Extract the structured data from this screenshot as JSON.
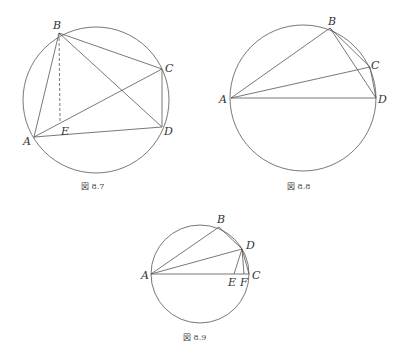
{
  "figures": [
    {
      "caption": "図 8.7",
      "circle": {
        "cx": 96,
        "cy": 100,
        "r": 73
      },
      "points": {
        "A": {
          "x": 34,
          "y": 137,
          "label": "A"
        },
        "B": {
          "x": 59,
          "y": 33,
          "label": "B"
        },
        "C": {
          "x": 162,
          "y": 69,
          "label": "C"
        },
        "D": {
          "x": 162,
          "y": 127,
          "label": "D"
        },
        "E": {
          "x": 60,
          "y": 124,
          "label": "E"
        }
      }
    },
    {
      "caption": "図 8.8",
      "circle": {
        "cx": 303,
        "cy": 98,
        "r": 73
      },
      "points": {
        "A": {
          "x": 231,
          "y": 98,
          "label": "A"
        },
        "B": {
          "x": 330,
          "y": 28,
          "label": "B"
        },
        "C": {
          "x": 370,
          "y": 67,
          "label": "C"
        },
        "D": {
          "x": 376,
          "y": 98,
          "label": "D"
        }
      }
    },
    {
      "caption": "図 8.9",
      "circle": {
        "cx": 200,
        "cy": 274,
        "r": 49
      },
      "points": {
        "A": {
          "x": 151,
          "y": 274,
          "label": "A"
        },
        "B": {
          "x": 219,
          "y": 227,
          "label": "B"
        },
        "C": {
          "x": 249,
          "y": 274,
          "label": "C"
        },
        "D": {
          "x": 242,
          "y": 249,
          "label": "D"
        },
        "E": {
          "x": 234,
          "y": 274,
          "label": "E"
        },
        "F": {
          "x": 244,
          "y": 274,
          "label": "F"
        }
      }
    }
  ]
}
